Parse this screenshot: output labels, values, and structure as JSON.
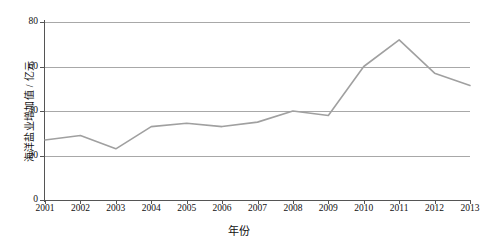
{
  "chart_data": {
    "type": "line",
    "title": "",
    "xlabel": "年份",
    "ylabel": "海洋盐业增加值 / 亿元",
    "categories": [
      "2001",
      "2002",
      "2003",
      "2004",
      "2005",
      "2006",
      "2007",
      "2008",
      "2009",
      "2010",
      "2011",
      "2012",
      "2013"
    ],
    "x": [
      2001,
      2002,
      2003,
      2004,
      2005,
      2006,
      2007,
      2008,
      2009,
      2010,
      2011,
      2012,
      2013
    ],
    "values": [
      27,
      29,
      23,
      33,
      34.5,
      33,
      35,
      40,
      38,
      60,
      72,
      57,
      51.5
    ],
    "series": [
      {
        "name": "海洋盐业增加值",
        "values": [
          27,
          29,
          23,
          33,
          34.5,
          33,
          35,
          40,
          38,
          60,
          72,
          57,
          51.5
        ]
      }
    ],
    "ylim": [
      0,
      80
    ],
    "xlim": [
      2001,
      2013
    ],
    "yticks": [
      0,
      20,
      40,
      60,
      80
    ],
    "ytick_labels": [
      "0",
      "20",
      "40",
      "60",
      "80"
    ],
    "grid": true,
    "grid_axis": "y",
    "legend": false,
    "legend_position": "none",
    "line_color": "#a0a0a0",
    "grid_color": "#a8a8a8",
    "axis_color": "#555555",
    "background_color": "#ffffff"
  },
  "axes": {
    "y_title": "海洋盐业增加值 / 亿元",
    "x_title": "年份"
  }
}
